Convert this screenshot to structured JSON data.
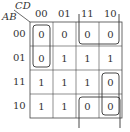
{
  "kmap": {
    "row_var": "AB",
    "col_var": "CD",
    "col_labels": [
      "00",
      "01",
      "11",
      "10"
    ],
    "row_labels": [
      "00",
      "01",
      "11",
      "10"
    ],
    "cells": [
      [
        "0",
        "0",
        "0",
        "0"
      ],
      [
        "0",
        "1",
        "1",
        "1"
      ],
      [
        "1",
        "1",
        "1",
        "0"
      ],
      [
        "1",
        "1",
        "0",
        "0"
      ]
    ],
    "groups": [
      {
        "name": "group-col00-rows00-01",
        "cells": [
          [
            0,
            0
          ],
          [
            1,
            0
          ]
        ]
      },
      {
        "name": "group-row00-cols11-10",
        "cells": [
          [
            0,
            2
          ],
          [
            0,
            3
          ]
        ]
      },
      {
        "name": "group-col10-rows11-10",
        "cells": [
          [
            2,
            3
          ],
          [
            3,
            3
          ]
        ]
      },
      {
        "name": "group-row10-cols11-10-wrap",
        "cells": [
          [
            3,
            2
          ],
          [
            3,
            3
          ],
          [
            0,
            2
          ],
          [
            0,
            3
          ]
        ]
      }
    ],
    "line_color": "#444444"
  }
}
